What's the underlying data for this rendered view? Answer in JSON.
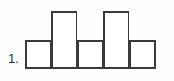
{
  "figure": {
    "item_number": "1.",
    "background_color": "#fdfdfb",
    "line_color": "#3a3a3a",
    "fill_color": "#ffffff"
  },
  "chart_data": {
    "type": "bar",
    "title": "",
    "subtitle": "",
    "xlabel": "",
    "ylabel": "",
    "categories": [
      "1",
      "2",
      "3",
      "4",
      "5"
    ],
    "values": [
      1,
      2,
      1,
      2,
      1
    ],
    "ylim": [
      0,
      2
    ],
    "xlim": [
      0,
      5
    ],
    "grid": false,
    "legend": false,
    "legend_position": "none",
    "tick_labels_x": [],
    "tick_labels_y": [],
    "annotations": [
      "1."
    ],
    "bar_gap": 0
  }
}
